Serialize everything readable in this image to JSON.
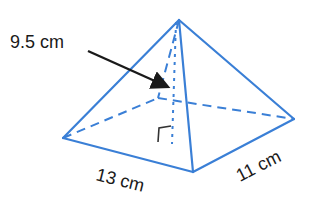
{
  "diagram": {
    "type": "square-based pyramid (rectangular base)",
    "labels": {
      "height": "9.5 cm",
      "base_length": "13 cm",
      "base_width": "11 cm"
    },
    "colors": {
      "edge": "#3a7fd6",
      "text": "#1a1a1a",
      "background": "#ffffff"
    }
  }
}
